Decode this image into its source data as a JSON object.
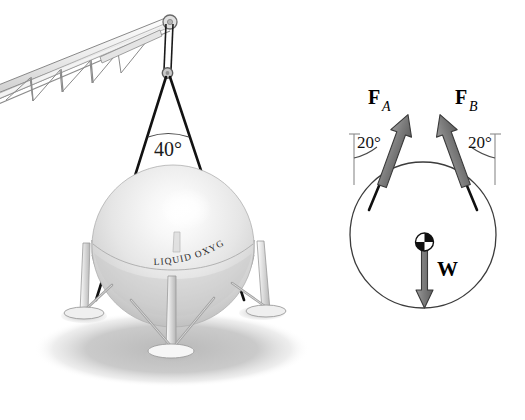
{
  "figure": {
    "background_color": "#ffffff",
    "width": 525,
    "height": 420
  },
  "pictorial": {
    "name": "crane-and-tank-pictorial",
    "sling_angle_label": "40°",
    "tank_label": "LIQUID OXYGEN",
    "colors": {
      "cable": "#141414",
      "boom_outline": "#6e6e6e",
      "boom_fill": "#e8e8e8",
      "tank_light": "#fbfbfb",
      "tank_mid": "#e3e3e3",
      "tank_shade": "#c9c9c9",
      "skirt": "#d6d6d6",
      "leg": "#d2d2d2",
      "ground_shadow": "#bcbcbc"
    }
  },
  "free_body_diagram": {
    "name": "free-body-diagram",
    "force_a_label": "F",
    "force_a_subscript": "A",
    "force_b_label": "F",
    "force_b_subscript": "B",
    "weight_label": "W",
    "angle_a_label": "20°",
    "angle_b_label": "20°",
    "colors": {
      "arrow_fill": "#7d7d7d",
      "arrow_stroke": "#3a3a3a",
      "circle_stroke": "#3c3c3c",
      "reference_line": "#8a8a8a",
      "cg_dark": "#101010",
      "cg_light": "#ffffff",
      "text": "#000000"
    },
    "geometry": {
      "circle_cx": 423,
      "circle_cy": 235,
      "circle_r": 73,
      "angle_from_vertical_deg": 20
    }
  }
}
